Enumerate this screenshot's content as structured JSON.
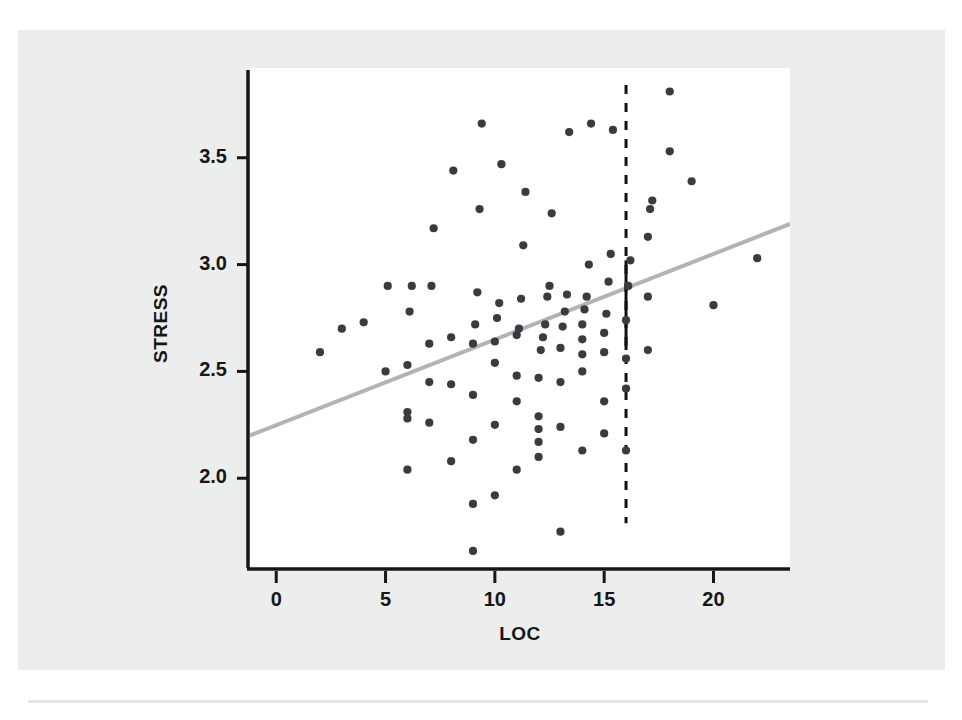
{
  "figure": {
    "background_color": "#eceded",
    "plot_background_color": "#ffffff",
    "axis_color": "#161616",
    "point_color": "#3a3a42",
    "trend_color": "#b3b3b3",
    "reference_color": "#111111"
  },
  "chart_data": {
    "type": "scatter",
    "title": "",
    "xlabel": "LOC",
    "ylabel": "STRESS",
    "xlim": [
      -1.2,
      23.5
    ],
    "ylim": [
      1.58,
      3.92
    ],
    "xticks": [
      0,
      5,
      10,
      15,
      20
    ],
    "xtick_labels": [
      "0",
      "5",
      "10",
      "15",
      "20"
    ],
    "yticks": [
      2.0,
      2.5,
      3.0,
      3.5
    ],
    "ytick_labels": [
      "2.0",
      "2.5",
      "3.0",
      "3.5"
    ],
    "grid": false,
    "legend": null,
    "trend_line": {
      "name": "regression line",
      "x_start": -1.2,
      "y_start": 2.2,
      "x_end": 23.5,
      "y_end": 3.19,
      "slope": 0.04,
      "intercept": 2.248,
      "color": "#b3b3b3",
      "width": 4
    },
    "reference_line": {
      "name": "vertical reference at LOC = 16",
      "x": 16,
      "y_min": 1.79,
      "y_max": 3.84,
      "style": "dashed",
      "solid_segment": {
        "y_min": 2.6,
        "y_max": 3.02
      },
      "marker_y": 2.42
    },
    "x": [
      2.0,
      3.0,
      4.0,
      5.0,
      5.1,
      6.0,
      6.0,
      6.0,
      6.0,
      6.1,
      6.2,
      7.0,
      7.0,
      7.0,
      7.1,
      7.2,
      8.0,
      8.0,
      8.0,
      8.1,
      9.0,
      9.0,
      9.0,
      9.0,
      9.0,
      9.1,
      9.2,
      9.3,
      9.4,
      10.0,
      10.0,
      10.0,
      10.0,
      10.1,
      10.2,
      10.3,
      11.0,
      11.0,
      11.0,
      11.0,
      11.1,
      11.2,
      11.3,
      11.4,
      12.0,
      12.0,
      12.0,
      12.0,
      12.0,
      12.1,
      12.2,
      12.3,
      12.4,
      12.5,
      12.6,
      13.0,
      13.0,
      13.0,
      13.0,
      13.1,
      13.2,
      13.3,
      13.4,
      14.0,
      14.0,
      14.0,
      14.0,
      14.0,
      14.1,
      14.2,
      14.3,
      14.4,
      15.0,
      15.0,
      15.0,
      15.0,
      15.1,
      15.2,
      15.3,
      15.4,
      16.0,
      16.0,
      16.0,
      16.0,
      16.1,
      16.2,
      17.0,
      17.0,
      17.0,
      17.1,
      17.2,
      18.0,
      18.0,
      19.0,
      20.0,
      22.0
    ],
    "y": [
      2.59,
      2.7,
      2.73,
      2.5,
      2.9,
      2.04,
      2.28,
      2.31,
      2.53,
      2.78,
      2.9,
      2.26,
      2.45,
      2.63,
      2.9,
      3.17,
      2.08,
      2.44,
      2.66,
      3.44,
      1.66,
      1.88,
      2.18,
      2.39,
      2.63,
      2.72,
      2.87,
      3.26,
      3.66,
      1.92,
      2.25,
      2.54,
      2.64,
      2.75,
      2.82,
      3.47,
      2.04,
      2.36,
      2.48,
      2.67,
      2.7,
      2.84,
      3.09,
      3.34,
      2.1,
      2.17,
      2.23,
      2.29,
      2.47,
      2.6,
      2.66,
      2.72,
      2.85,
      2.9,
      3.24,
      1.75,
      2.24,
      2.45,
      2.61,
      2.71,
      2.78,
      2.86,
      3.62,
      2.13,
      2.5,
      2.58,
      2.65,
      2.72,
      2.79,
      2.85,
      3.0,
      3.66,
      2.21,
      2.36,
      2.59,
      2.68,
      2.77,
      2.92,
      3.05,
      3.63,
      2.13,
      2.42,
      2.56,
      2.74,
      2.9,
      3.02,
      2.6,
      2.85,
      3.13,
      3.26,
      3.3,
      3.53,
      3.81,
      3.39,
      2.81,
      3.03
    ]
  }
}
